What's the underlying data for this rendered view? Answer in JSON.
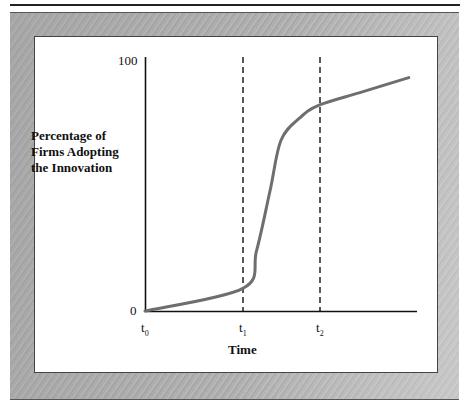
{
  "chart_data": {
    "type": "line",
    "title": "",
    "xlabel": "Time",
    "ylabel": "Percentage of Firms Adopting the Innovation",
    "ylabel_lines": [
      "Percentage of",
      "Firms Adopting",
      "the Innovation"
    ],
    "y_ticks": [
      "0",
      "100"
    ],
    "ylim": [
      0,
      100
    ],
    "x_ticks": [
      {
        "base": "t",
        "sub": "0"
      },
      {
        "base": "t",
        "sub": "1"
      },
      {
        "base": "t",
        "sub": "2"
      }
    ],
    "grid": false,
    "legend": null,
    "vertical_reference_lines": [
      {
        "at": "t1",
        "style": "dashed"
      },
      {
        "at": "t2",
        "style": "dashed"
      }
    ],
    "series": [
      {
        "name": "Diffusion S-curve",
        "color": "#6e6e6e",
        "x_relative_to_axis": [
          0.0,
          0.36,
          0.41,
          0.46,
          0.5,
          0.57,
          0.64,
          0.79,
          0.97
        ],
        "values": [
          0,
          9,
          24,
          48,
          68,
          77,
          82,
          87,
          93
        ]
      }
    ],
    "annotations": [
      "t0 at origin",
      "t1: curve begins rapid rise (~9%)",
      "t2: curve flattens (~82%)"
    ]
  },
  "labels": {
    "ylabel_line1": "Percentage of",
    "ylabel_line2": "Firms Adopting",
    "ylabel_line3": "the Innovation",
    "y_top": "100",
    "y_bottom": "0",
    "t_base": "t",
    "t0_sub": "0",
    "t1_sub": "1",
    "t2_sub": "2",
    "xlabel": "Time"
  },
  "colors": {
    "curve": "#6e6e6e",
    "axes": "#111111",
    "frame": "#b0b0b0"
  }
}
